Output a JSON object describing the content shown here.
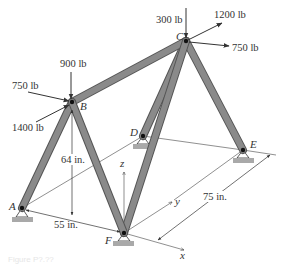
{
  "figure": {
    "caption": "Figure P?.??",
    "colors": {
      "member_fill": "#8a8a8a",
      "member_edge": "#555555",
      "support_fill": "#a9a9a9",
      "line": "#333333"
    }
  },
  "nodes": {
    "A": {
      "label": "A",
      "x": 22,
      "y": 208
    },
    "B": {
      "label": "B",
      "x": 72,
      "y": 102
    },
    "C": {
      "label": "C",
      "x": 186,
      "y": 41
    },
    "D": {
      "label": "D",
      "x": 143,
      "y": 136
    },
    "E": {
      "label": "E",
      "x": 243,
      "y": 150
    },
    "F": {
      "label": "F",
      "x": 124,
      "y": 233
    }
  },
  "members": [
    {
      "name": "AB",
      "from": "A",
      "to": "B"
    },
    {
      "name": "BF",
      "from": "B",
      "to": "F"
    },
    {
      "name": "BC",
      "from": "B",
      "to": "C"
    },
    {
      "name": "CF",
      "from": "C",
      "to": "F"
    },
    {
      "name": "CD",
      "from": "C",
      "to": "D"
    },
    {
      "name": "CE",
      "from": "C",
      "to": "E"
    }
  ],
  "loads": {
    "B": [
      {
        "label": "900 lb",
        "direction": "down"
      },
      {
        "label": "750 lb",
        "direction": "right-down"
      },
      {
        "label": "1400 lb",
        "direction": "right-up"
      }
    ],
    "C": [
      {
        "label": "300 lb",
        "direction": "down"
      },
      {
        "label": "1200 lb",
        "direction": "right-up"
      },
      {
        "label": "750 lb",
        "direction": "right"
      }
    ]
  },
  "dimensions": {
    "height": "64 in.",
    "width_AF": "55 in.",
    "depth": "75 in."
  },
  "axes": {
    "x": "x",
    "y": "y",
    "z": "z"
  },
  "supports": [
    "A",
    "D",
    "E",
    "F"
  ]
}
